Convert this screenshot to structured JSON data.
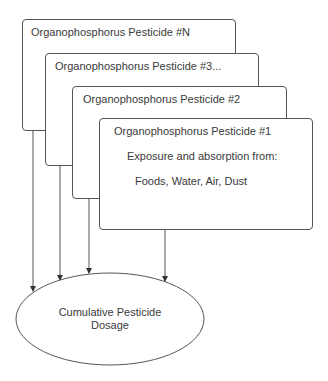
{
  "diagram": {
    "boxes": [
      {
        "id": "pN",
        "title": "Organophosphorus Pesticide #N"
      },
      {
        "id": "p3",
        "title": "Organophosphorus Pesticide #3..."
      },
      {
        "id": "p2",
        "title": "Organophosphorus Pesticide #2"
      },
      {
        "id": "p1",
        "title": "Organophosphorus Pesticide #1",
        "lines": [
          "Exposure and absorption from:",
          "Foods, Water, Air, Dust"
        ]
      }
    ],
    "target": {
      "line1": "Cumulative Pesticide",
      "line2": "Dosage"
    },
    "colors": {
      "stroke": "#555555",
      "text": "#3a3a3a",
      "background": "#ffffff"
    }
  }
}
